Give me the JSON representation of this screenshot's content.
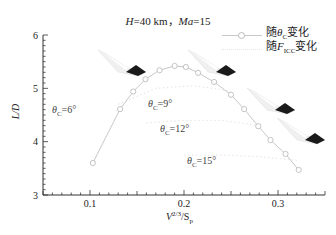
{
  "chart_data": {
    "type": "line",
    "xlabel": "V^(2/3)/S_p",
    "ylabel": "L/D",
    "xlim": [
      0.05,
      0.35
    ],
    "ylim": [
      3,
      6
    ],
    "xticks": [
      0.1,
      0.2,
      0.3
    ],
    "yticks": [
      3,
      4,
      5,
      6
    ],
    "grid": false,
    "legend_position": "upper right",
    "legend": [
      "随θc变化",
      "随F_ICC变化"
    ],
    "series": [
      {
        "name": "随θc变化",
        "style": "solid line, open circle markers",
        "x": [
          0.103,
          0.132,
          0.146,
          0.159,
          0.174,
          0.19,
          0.202,
          0.215,
          0.232,
          0.25,
          0.264,
          0.279,
          0.292,
          0.308,
          0.322
        ],
        "y": [
          3.6,
          4.61,
          4.94,
          5.17,
          5.34,
          5.42,
          5.4,
          5.29,
          5.12,
          4.88,
          4.61,
          4.29,
          4.03,
          3.77,
          3.47
        ]
      },
      {
        "name": "随F_ICC变化 (θc=9°)",
        "style": "faint dotted",
        "x": [
          0.13,
          0.17,
          0.21,
          0.25
        ],
        "y": [
          4.7,
          5.0,
          5.05,
          4.95
        ]
      },
      {
        "name": "随F_ICC变化 (θc=12°)",
        "style": "faint dotted",
        "x": [
          0.16,
          0.2,
          0.24,
          0.28
        ],
        "y": [
          4.35,
          4.4,
          4.4,
          4.3
        ]
      },
      {
        "name": "随F_ICC变化 (θc=15°)",
        "style": "faint dotted",
        "x": [
          0.2,
          0.24,
          0.28,
          0.32
        ],
        "y": [
          3.75,
          3.75,
          3.72,
          3.65
        ]
      }
    ],
    "annotations": [
      {
        "text": "θc=6°",
        "x": 0.085,
        "y": 4.45
      },
      {
        "text": "θc=9°",
        "x": 0.18,
        "y": 4.55
      },
      {
        "text": "θc=12°",
        "x": 0.205,
        "y": 4.05
      },
      {
        "text": "θc=15°",
        "x": 0.23,
        "y": 3.55
      }
    ]
  },
  "title_parts": {
    "h": "H",
    "h_val": "=40 km，",
    "ma": "Ma",
    "ma_val": "=15"
  },
  "legend": {
    "item1_prefix": "随",
    "item1_sym": "θ",
    "item1_sub": "C",
    "item1_suffix": "变化",
    "item2_prefix": "随",
    "item2_sym": "F",
    "item2_sub": "ICC",
    "item2_suffix": "变化"
  },
  "axes": {
    "ylabel": "L/D",
    "x_ticks": [
      "0.1",
      "0.2",
      "0.3"
    ],
    "y_ticks": [
      "3",
      "4",
      "5",
      "6"
    ],
    "xlabel_v": "V",
    "xlabel_sup": "2/3",
    "xlabel_s": "/S",
    "xlabel_sub": "p"
  },
  "annotations": {
    "a6_sub": "C",
    "a6_val": "=6°",
    "a9_sub": "C",
    "a9_val": "=9°",
    "a12_sub": "C",
    "a12_val": "=12°",
    "a15_sub": "C",
    "a15_val": "=15°",
    "theta": "θ"
  }
}
